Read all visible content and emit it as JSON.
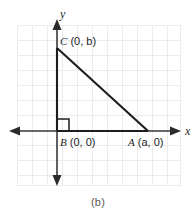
{
  "figure": {
    "caption": "(b)",
    "type": "coordinate-plane-right-triangle",
    "background_color": "#ffffff",
    "grid_color": "#e9e9ec",
    "axis_color": "#3a3a3c",
    "shape_color": "#1d1d1f",
    "axes": {
      "x_label": "x",
      "y_label": "y"
    },
    "vertices": [
      {
        "id": "C",
        "name": "C",
        "coords": "(0, b)",
        "label": "C (0, b)"
      },
      {
        "id": "B",
        "name": "B",
        "coords": "(0, 0)",
        "label": "B (0, 0)"
      },
      {
        "id": "A",
        "name": "A",
        "coords": "(a, 0)",
        "label": "A (a, 0)"
      }
    ],
    "right_angle_at": "B",
    "labels": {
      "c_label": "C (0, b)",
      "b_label": "B (0, 0)",
      "a_label": "A (a, 0)",
      "c_name": "C",
      "c_coords": " (0, b)",
      "b_name": "B",
      "b_coords": " (0, 0)",
      "a_name": "A",
      "a_coords": " (a, 0)"
    }
  }
}
